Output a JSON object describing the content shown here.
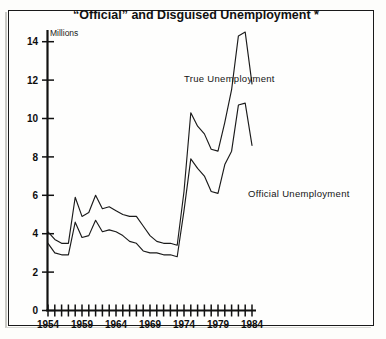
{
  "figure": {
    "title": "“Official” and Disguised Unemployment *",
    "unit_label": "Millions",
    "border_color": "#1a1a1a",
    "line_color": "#1b1b1b",
    "background_color": "#fefefd"
  },
  "chart_data": {
    "type": "line",
    "title": "“Official” and Disguised Unemployment *",
    "subtitle": "",
    "xlabel": "",
    "ylabel": "Millions",
    "ylim": [
      0,
      15
    ],
    "xlim": [
      1954,
      1984
    ],
    "yticks": [
      0,
      2,
      4,
      6,
      8,
      10,
      12,
      14
    ],
    "ytick_labels": [
      "0",
      "2",
      "4",
      "6",
      "8",
      "10",
      "12",
      "14"
    ],
    "xticks": [
      1954,
      1955,
      1956,
      1957,
      1958,
      1959,
      1960,
      1961,
      1962,
      1963,
      1964,
      1965,
      1966,
      1967,
      1968,
      1969,
      1970,
      1971,
      1972,
      1973,
      1974,
      1975,
      1976,
      1977,
      1978,
      1979,
      1980,
      1981,
      1982,
      1983,
      1984
    ],
    "xtick_labels": [
      "1954",
      "1959",
      "1964",
      "1969",
      "1974",
      "1979",
      "1984"
    ],
    "xtick_label_years": [
      1954,
      1959,
      1964,
      1969,
      1974,
      1979,
      1984
    ],
    "grid": false,
    "legend_position": "inline-annotations",
    "x": [
      1954,
      1955,
      1956,
      1957,
      1958,
      1959,
      1960,
      1961,
      1962,
      1963,
      1964,
      1965,
      1966,
      1967,
      1968,
      1969,
      1970,
      1971,
      1972,
      1973,
      1974,
      1975,
      1976,
      1977,
      1978,
      1979,
      1980,
      1981,
      1982,
      1983,
      1984
    ],
    "series": [
      {
        "name": "True Unemployment",
        "label": "True Unemployment",
        "values": [
          4.1,
          3.7,
          3.5,
          3.5,
          5.9,
          4.9,
          5.1,
          6.0,
          5.3,
          5.4,
          5.2,
          5.0,
          4.9,
          4.9,
          4.4,
          3.9,
          3.6,
          3.5,
          3.5,
          3.4,
          6.2,
          10.3,
          9.6,
          9.2,
          8.4,
          8.3,
          9.8,
          11.5,
          14.3,
          14.5,
          11.8
        ]
      },
      {
        "name": "Official Unemployment",
        "label": "Official Unemployment",
        "values": [
          3.5,
          3.0,
          2.9,
          2.9,
          4.6,
          3.8,
          3.9,
          4.7,
          4.1,
          4.2,
          4.1,
          3.9,
          3.6,
          3.5,
          3.1,
          3.0,
          3.0,
          2.9,
          2.9,
          2.8,
          5.2,
          7.9,
          7.4,
          7.0,
          6.2,
          6.1,
          7.6,
          8.3,
          10.7,
          10.8,
          8.6
        ]
      }
    ],
    "annotations": [
      {
        "text": "True Unemployment",
        "x": 1972.5,
        "y": 11.6
      },
      {
        "text": "Official Unemployment",
        "x": 1975.5,
        "y": 5.4
      },
      {
        "text": "Millions",
        "x": 1955.5,
        "y": 13.8
      }
    ]
  }
}
